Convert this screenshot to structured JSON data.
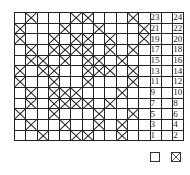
{
  "chart": {
    "rows": [
      {
        "left": "23",
        "right": "24",
        "cells": [
          0,
          1,
          0,
          0,
          0,
          1,
          1,
          0,
          0,
          0,
          1,
          0
        ]
      },
      {
        "left": "21",
        "right": "22",
        "cells": [
          1,
          0,
          0,
          0,
          1,
          0,
          0,
          1,
          0,
          0,
          0,
          1
        ]
      },
      {
        "left": "19",
        "right": "20",
        "cells": [
          1,
          0,
          0,
          1,
          0,
          1,
          1,
          0,
          1,
          0,
          0,
          1
        ]
      },
      {
        "left": "17",
        "right": "18",
        "cells": [
          0,
          1,
          0,
          1,
          1,
          1,
          1,
          0,
          1,
          0,
          1,
          0
        ]
      },
      {
        "left": "15",
        "right": "16",
        "cells": [
          0,
          1,
          1,
          0,
          1,
          0,
          1,
          1,
          0,
          1,
          0,
          0
        ]
      },
      {
        "left": "13",
        "right": "14",
        "cells": [
          1,
          0,
          1,
          1,
          0,
          0,
          1,
          1,
          1,
          0,
          1,
          0
        ]
      },
      {
        "left": "11",
        "right": "12",
        "cells": [
          1,
          0,
          0,
          1,
          0,
          0,
          1,
          0,
          0,
          0,
          1,
          0
        ]
      },
      {
        "left": "9",
        "right": "10",
        "cells": [
          0,
          1,
          0,
          1,
          1,
          1,
          0,
          0,
          0,
          1,
          0,
          0
        ]
      },
      {
        "left": "7",
        "right": "8",
        "cells": [
          0,
          1,
          0,
          1,
          1,
          1,
          1,
          0,
          1,
          0,
          0,
          0
        ]
      },
      {
        "left": "5",
        "right": "6",
        "cells": [
          1,
          0,
          0,
          1,
          0,
          0,
          0,
          1,
          0,
          0,
          1,
          0
        ]
      },
      {
        "left": "3",
        "right": "4",
        "cells": [
          0,
          1,
          0,
          0,
          1,
          0,
          0,
          1,
          0,
          1,
          0,
          0
        ]
      },
      {
        "left": "1",
        "right": "2",
        "cells": [
          0,
          0,
          1,
          0,
          0,
          1,
          1,
          0,
          0,
          1,
          0,
          0
        ]
      }
    ]
  },
  "legend": {
    "items": [
      {
        "symbol": "empty-square",
        "label": ""
      },
      {
        "symbol": "crossed-square",
        "label": ""
      }
    ]
  },
  "colors": {
    "line": "#222222",
    "background": "#ffffff"
  }
}
